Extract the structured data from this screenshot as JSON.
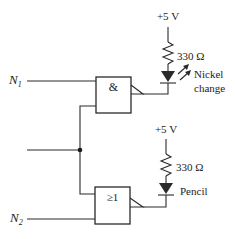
{
  "inputs": {
    "n1": {
      "label": "N",
      "sub": "1"
    },
    "n2": {
      "label": "N",
      "sub": "2"
    }
  },
  "gates": {
    "and_gate": {
      "symbol": "&"
    },
    "or_gate": {
      "symbol": "≥1"
    }
  },
  "upper_branch": {
    "supply": "+5 V",
    "resistor": "330 Ω",
    "output_label_line1": "Nickel",
    "output_label_line2": "change"
  },
  "lower_branch": {
    "supply": "+5 V",
    "resistor": "330 Ω",
    "output_label": "Pencil"
  },
  "colors": {
    "ink": "#2a2a2a",
    "background": "#ffffff"
  }
}
